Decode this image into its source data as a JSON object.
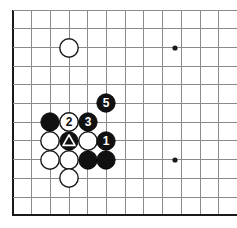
{
  "figure": {
    "kind": "go-board-diagram",
    "title": "Go board move sequence diagram",
    "board_size_visible_cols": 12,
    "board_size_visible_rows": 11,
    "colors": {
      "grid": "#8a8a8a",
      "edge": "#1a1a1a",
      "black_stone": "#111111",
      "white_stone": "#ffffff",
      "background": "#ffffff"
    }
  },
  "geometry": {
    "origin_x": 13,
    "origin_y": 10,
    "spacing": 18.7,
    "cols": 12,
    "rows": 11,
    "stone_radius": 9.2,
    "left_edge_x": 13,
    "bottom_edge_y": 215
  },
  "hoshi_points": [
    {
      "name": "star-point-upper-right",
      "cx": 175,
      "cy": 48
    },
    {
      "name": "star-point-lower-right",
      "cx": 175,
      "cy": 160
    }
  ],
  "stones": [
    {
      "id": "white-upper-left-corner",
      "color": "white",
      "cx": 69,
      "cy": 48,
      "label": "",
      "mark": ""
    },
    {
      "id": "black-top-of-group",
      "color": "black",
      "cx": 69,
      "cy": 122,
      "label": "",
      "mark": ""
    },
    {
      "id": "black-left-of-two",
      "color": "black",
      "cx": 50,
      "cy": 122,
      "label": "",
      "mark": ""
    },
    {
      "id": "white-move-2",
      "color": "white",
      "cx": 69,
      "cy": 122,
      "label": "2",
      "mark": ""
    },
    {
      "id": "black-move-3",
      "color": "black",
      "cx": 88,
      "cy": 122,
      "label": "3",
      "mark": ""
    },
    {
      "id": "black-move-5",
      "color": "black",
      "cx": 106,
      "cy": 103,
      "label": "5",
      "mark": ""
    },
    {
      "id": "black-move-1",
      "color": "black",
      "cx": 106,
      "cy": 141,
      "label": "1",
      "mark": ""
    },
    {
      "id": "black-triangle-marked",
      "color": "black",
      "cx": 69,
      "cy": 141,
      "label": "",
      "mark": "triangle"
    },
    {
      "id": "white-left-middle",
      "color": "white",
      "cx": 50,
      "cy": 141,
      "label": "",
      "mark": ""
    },
    {
      "id": "white-right-of-triangle",
      "color": "white",
      "cx": 88,
      "cy": 141,
      "label": "",
      "mark": ""
    },
    {
      "id": "white-lower-left",
      "color": "white",
      "cx": 50,
      "cy": 160,
      "label": "",
      "mark": ""
    },
    {
      "id": "white-lower-center",
      "color": "white",
      "cx": 69,
      "cy": 160,
      "label": "",
      "mark": ""
    },
    {
      "id": "black-lower-inner",
      "color": "black",
      "cx": 88,
      "cy": 160,
      "label": "",
      "mark": ""
    },
    {
      "id": "black-lower-right",
      "color": "black",
      "cx": 106,
      "cy": 160,
      "label": "",
      "mark": ""
    },
    {
      "id": "white-bottom-tail",
      "color": "white",
      "cx": 69,
      "cy": 178,
      "label": "",
      "mark": ""
    }
  ],
  "stone_render_order": [
    "white-upper-left-corner",
    "white-left-middle",
    "white-right-of-triangle",
    "white-lower-left",
    "white-lower-center",
    "white-bottom-tail",
    "black-left-of-two",
    "black-lower-inner",
    "black-lower-right",
    "black-top-of-group",
    "black-triangle-marked",
    "white-move-2",
    "black-move-3",
    "black-move-1",
    "black-move-5"
  ],
  "move_labels": {
    "move_1": "1",
    "move_2": "2",
    "move_3": "3",
    "move_5": "5"
  },
  "marks": {
    "triangle": "triangle-mark"
  }
}
